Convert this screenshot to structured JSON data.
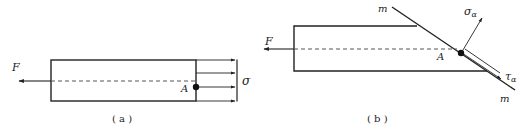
{
  "figure_a": {
    "caption": "( a )",
    "force_label": "F",
    "point_label": "A",
    "stress_label": "σ"
  },
  "figure_b": {
    "caption": "( b )",
    "force_label": "F",
    "point_label": "A",
    "plane_label_top": "m",
    "plane_label_bottom": "m",
    "normal_stress_label": "σ",
    "normal_stress_sub": "α",
    "shear_stress_label": "τ",
    "shear_stress_sub": "α"
  },
  "colors": {
    "line": "#222222",
    "background": "#ffffff"
  }
}
